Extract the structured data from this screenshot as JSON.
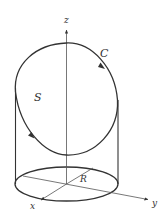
{
  "diagram": {
    "labels": {
      "z_axis": "z",
      "x_axis": "x",
      "y_axis": "y",
      "radius": "R",
      "curve": "C",
      "surface": "S"
    },
    "colors": {
      "stroke": "#333333",
      "thin_stroke": "#555555",
      "background": "#ffffff"
    }
  }
}
